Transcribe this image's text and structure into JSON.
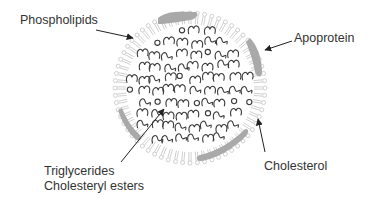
{
  "diagram": {
    "labels": {
      "phospholipids": "Phospholipids",
      "apoprotein": "Apoprotein",
      "cholesterol": "Cholesterol",
      "triglycerides": "Triglycerides",
      "cholesteryl_esters": "Cholesteryl esters"
    },
    "colors": {
      "text": "#333333",
      "arrow": "#222222",
      "core_lipid": "#333333",
      "phospholipid": "#c8c8c8",
      "apoprotein": "#a8a8a8"
    }
  }
}
